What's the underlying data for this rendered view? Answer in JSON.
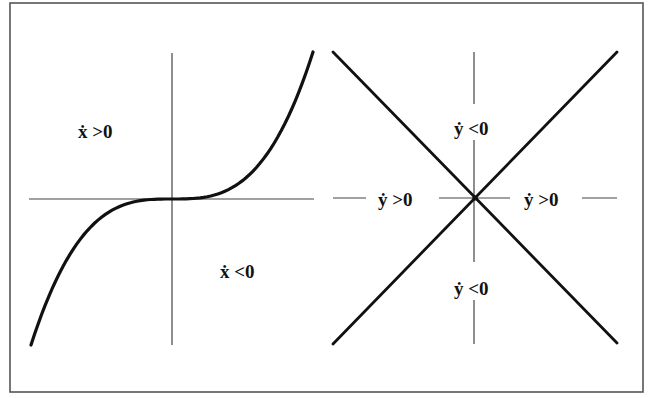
{
  "figure": {
    "type": "phase-diagram",
    "frame": {
      "x": 10,
      "y": 3,
      "width": 633,
      "height": 389,
      "stroke": "#555555"
    },
    "colors": {
      "curve": "#111111",
      "axis": "#444444",
      "text": "#111111",
      "background": "#ffffff"
    }
  },
  "left_panel": {
    "description": "Cubic nullcline for x-dot = 0 with sign regions",
    "axes": {
      "vertical": {
        "x": 172,
        "y1": 53,
        "y2": 345
      },
      "horizontal": {
        "y": 199,
        "x1": 29,
        "x2": 314
      }
    },
    "curve": {
      "shape": "cubic",
      "start": [
        31,
        345
      ],
      "center": [
        172,
        199
      ],
      "end": [
        313,
        52
      ]
    },
    "labels": [
      {
        "id": "xdot-positive",
        "text": "ẋ >0",
        "x": 78,
        "y": 138
      },
      {
        "id": "xdot-negative",
        "text": "ẋ <0",
        "x": 220,
        "y": 278
      }
    ]
  },
  "right_panel": {
    "description": "Crossed nullclines for y-dot = 0 with sign regions",
    "center": [
      475,
      198
    ],
    "lines": [
      {
        "id": "diagonal-descending",
        "x1": 333,
        "y1": 52,
        "x2": 617,
        "y2": 343
      },
      {
        "id": "diagonal-ascending",
        "x1": 617,
        "y1": 52,
        "x2": 333,
        "y2": 344
      }
    ],
    "axis_segments": [
      {
        "x1": 474,
        "y1": 52,
        "x2": 474,
        "y2": 104
      },
      {
        "x1": 474,
        "y1": 140,
        "x2": 474,
        "y2": 262
      },
      {
        "x1": 474,
        "y1": 300,
        "x2": 474,
        "y2": 344
      },
      {
        "x1": 333,
        "y1": 198,
        "x2": 366,
        "y2": 198
      },
      {
        "x1": 439,
        "y1": 198,
        "x2": 510,
        "y2": 198
      },
      {
        "x1": 582,
        "y1": 198,
        "x2": 617,
        "y2": 198
      }
    ],
    "labels": [
      {
        "id": "ydot-negative-top",
        "text": "ẏ <0",
        "x": 454,
        "y": 135
      },
      {
        "id": "ydot-positive-left",
        "text": "ẏ >0",
        "x": 378,
        "y": 206
      },
      {
        "id": "ydot-positive-right",
        "text": "ẏ >0",
        "x": 524,
        "y": 206
      },
      {
        "id": "ydot-negative-bottom",
        "text": "ẏ <0",
        "x": 454,
        "y": 295
      }
    ]
  }
}
